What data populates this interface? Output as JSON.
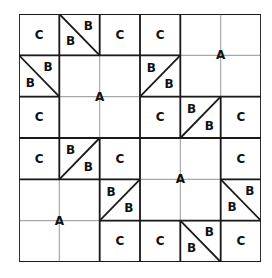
{
  "puzzle": {
    "rows": 6,
    "cols": 6,
    "colors": {
      "thick_line": "#1a1a1a",
      "thin_line": "#a8a8a8",
      "text": "#111111",
      "background": "#ffffff"
    },
    "cells": [
      {
        "r": 0,
        "c": 0,
        "type": "label",
        "text": "C"
      },
      {
        "r": 0,
        "c": 1,
        "type": "diag",
        "dir": "backslash",
        "top": "B",
        "bottom": "B"
      },
      {
        "r": 0,
        "c": 2,
        "type": "label",
        "text": "C"
      },
      {
        "r": 0,
        "c": 3,
        "type": "label",
        "text": "C"
      },
      {
        "r": 1,
        "c": 0,
        "type": "diag",
        "dir": "backslash",
        "top": "B",
        "bottom": "B"
      },
      {
        "r": 1,
        "c": 3,
        "type": "diag",
        "dir": "slash",
        "top": "B",
        "bottom": "B"
      },
      {
        "r": 2,
        "c": 0,
        "type": "label",
        "text": "C"
      },
      {
        "r": 2,
        "c": 3,
        "type": "label",
        "text": "C"
      },
      {
        "r": 2,
        "c": 4,
        "type": "diag",
        "dir": "slash",
        "top": "B",
        "bottom": "B"
      },
      {
        "r": 2,
        "c": 5,
        "type": "label",
        "text": "C"
      },
      {
        "r": 3,
        "c": 0,
        "type": "label",
        "text": "C"
      },
      {
        "r": 3,
        "c": 1,
        "type": "diag",
        "dir": "slash",
        "top": "B",
        "bottom": "B"
      },
      {
        "r": 3,
        "c": 2,
        "type": "label",
        "text": "C"
      },
      {
        "r": 3,
        "c": 5,
        "type": "label",
        "text": "C"
      },
      {
        "r": 4,
        "c": 2,
        "type": "diag",
        "dir": "slash",
        "top": "B",
        "bottom": "B"
      },
      {
        "r": 4,
        "c": 5,
        "type": "diag",
        "dir": "backslash",
        "top": "B",
        "bottom": "B"
      },
      {
        "r": 5,
        "c": 2,
        "type": "label",
        "text": "C"
      },
      {
        "r": 5,
        "c": 3,
        "type": "label",
        "text": "C"
      },
      {
        "r": 5,
        "c": 4,
        "type": "diag",
        "dir": "backslash",
        "top": "B",
        "bottom": "B"
      },
      {
        "r": 5,
        "c": 5,
        "type": "label",
        "text": "C"
      }
    ],
    "regions": [
      {
        "r": 0,
        "c": 4,
        "rows": 2,
        "cols": 2,
        "text": "A"
      },
      {
        "r": 1,
        "c": 1,
        "rows": 2,
        "cols": 2,
        "text": "A"
      },
      {
        "r": 3,
        "c": 3,
        "rows": 2,
        "cols": 2,
        "text": "A"
      },
      {
        "r": 4,
        "c": 0,
        "rows": 2,
        "cols": 2,
        "text": "A"
      }
    ]
  }
}
